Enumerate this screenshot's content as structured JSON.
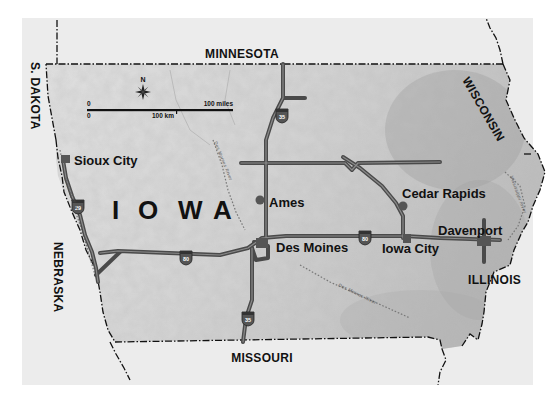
{
  "map": {
    "title": "IOWA",
    "title_letters": [
      "I",
      "O",
      "W",
      "A"
    ],
    "colors": {
      "frame_bg": "#ececec",
      "state_fill": "#d4d4d4",
      "border": "#111111",
      "road": "#4a4a4a",
      "text": "#111111"
    },
    "neighbor_states": {
      "north": "MINNESOTA",
      "northwest": "S. DAKOTA",
      "northeast": "WISCONSIN",
      "west": "NEBRASKA",
      "east": "ILLINOIS",
      "south": "MISSOURI"
    },
    "cities": [
      {
        "name": "Sioux City"
      },
      {
        "name": "Ames"
      },
      {
        "name": "Des Moines"
      },
      {
        "name": "Cedar Rapids"
      },
      {
        "name": "Iowa City"
      },
      {
        "name": "Davenport"
      }
    ],
    "interstates": [
      {
        "number": "29"
      },
      {
        "number": "35"
      },
      {
        "number": "80"
      }
    ],
    "rivers": [
      {
        "name": "Missouri River"
      },
      {
        "name": "Des Moines River"
      },
      {
        "name": "Mississippi River"
      }
    ],
    "compass": {
      "label": "N",
      "icon": "compass-rose-icon"
    },
    "scale": {
      "miles_start": "0",
      "miles_end": "100 miles",
      "km_start": "0",
      "km_end": "100 km"
    }
  }
}
